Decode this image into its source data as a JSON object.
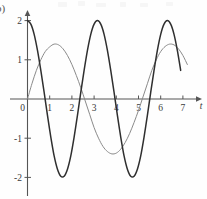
{
  "figure": {
    "part_label": "b)",
    "axis_label_x": "t",
    "axis_label_y": ""
  },
  "chart_data": {
    "type": "line",
    "title": "",
    "subtitle": "",
    "xlabel": "t",
    "ylabel": "",
    "xlim": [
      -0.15,
      7.6
    ],
    "ylim": [
      -2.62,
      2.32
    ],
    "xticks": [
      0,
      1,
      2,
      3,
      4,
      5,
      6,
      7
    ],
    "xticklabels": [
      "0",
      "1",
      "2",
      "3",
      "4",
      "5",
      "6",
      "7"
    ],
    "yticks": [
      2,
      1,
      -1,
      -2
    ],
    "yticklabels": [
      "2",
      "1",
      "-1",
      "-2"
    ],
    "grid": false,
    "legend": "none",
    "axis_style": "arrows-on-positive-ends",
    "series": [
      {
        "name": "dark-cosine",
        "color": "#2f2f2f",
        "linewidth": 1.5,
        "amplitude": 2.0,
        "period": 2.25,
        "phase_deg": 0,
        "form": "2*cos(2*pi*t/2.25)",
        "x": [
          0.0,
          0.15,
          0.3,
          0.45,
          0.6,
          0.75,
          0.9,
          1.05,
          1.2,
          1.35,
          1.5,
          1.65,
          1.8,
          1.95,
          2.1,
          2.25,
          2.4,
          2.55,
          2.7,
          2.85,
          3.0,
          3.15,
          3.3,
          3.45,
          3.6,
          3.75,
          3.9,
          4.05,
          4.2,
          4.35,
          4.5,
          4.65,
          4.8,
          4.95,
          5.1,
          5.25,
          5.4,
          5.55,
          5.7,
          5.85,
          6.0,
          6.15,
          6.3,
          6.45,
          6.6,
          6.75,
          6.9
        ],
        "y": [
          2.0,
          1.91,
          1.65,
          1.24,
          0.73,
          0.17,
          -0.42,
          -0.97,
          -1.45,
          -1.79,
          -1.97,
          -1.97,
          -1.79,
          -1.45,
          -0.97,
          -0.42,
          0.17,
          0.73,
          1.24,
          1.65,
          1.91,
          2.0,
          1.91,
          1.65,
          1.24,
          0.73,
          0.17,
          -0.42,
          -0.97,
          -1.45,
          -1.79,
          -1.97,
          -1.97,
          -1.79,
          -1.45,
          -0.97,
          -0.42,
          0.17,
          0.73,
          1.24,
          1.65,
          1.91,
          2.0,
          1.91,
          1.65,
          1.24,
          0.73
        ],
        "key_points": {
          "start": [
            0,
            2
          ],
          "minima": [
            [
              1.125,
              -2
            ],
            [
              3.375,
              -2
            ],
            [
              5.625,
              -2
            ]
          ],
          "maxima": [
            [
              0,
              2
            ],
            [
              2.25,
              2
            ],
            [
              4.5,
              2
            ]
          ],
          "zeros": [
            0.5625,
            1.6875,
            2.8125,
            3.9375,
            5.0625,
            6.1875
          ]
        }
      },
      {
        "name": "light-sine",
        "color": "#8a8a8a",
        "linewidth": 1.0,
        "amplitude": 1.4,
        "period": 4.5,
        "phase_deg": 0,
        "form": "1.4*sin(2*pi*t/4.5)",
        "x": [
          0.0,
          0.2,
          0.4,
          0.6,
          0.8,
          1.0,
          1.2,
          1.4,
          1.6,
          1.8,
          2.0,
          2.2,
          2.4,
          2.6,
          2.8,
          3.0,
          3.2,
          3.4,
          3.6,
          3.8,
          4.0,
          4.2,
          4.4,
          4.6,
          4.8,
          5.0,
          5.2,
          5.4,
          5.6,
          5.8,
          6.0,
          6.2,
          6.4,
          6.6,
          6.8,
          7.0,
          7.2
        ],
        "y": [
          0.0,
          0.39,
          0.73,
          1.0,
          1.21,
          1.33,
          1.4,
          1.38,
          1.28,
          1.11,
          0.88,
          0.6,
          0.29,
          -0.05,
          -0.39,
          -0.73,
          -1.0,
          -1.21,
          -1.34,
          -1.4,
          -1.38,
          -1.28,
          -1.11,
          -0.88,
          -0.6,
          -0.29,
          0.05,
          0.39,
          0.73,
          1.0,
          1.21,
          1.34,
          1.4,
          1.38,
          1.28,
          1.11,
          0.88
        ],
        "key_points": {
          "start": [
            0,
            0
          ],
          "maxima": [
            [
              1.125,
              1.4
            ],
            [
              5.625,
              1.4
            ]
          ],
          "minima": [
            [
              3.375,
              -1.4
            ]
          ],
          "zeros": [
            0,
            2.25,
            4.5,
            6.75
          ]
        }
      }
    ]
  }
}
